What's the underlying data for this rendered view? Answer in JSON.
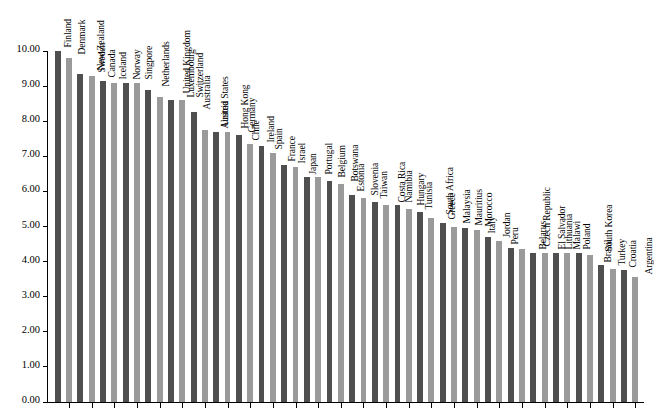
{
  "chart_data": {
    "type": "bar",
    "title": "",
    "subtitle": "",
    "xlabel": "",
    "ylabel": "",
    "ylim": [
      0.0,
      10.0
    ],
    "ytick_labels": [
      "0.00",
      "1.00",
      "2.00",
      "3.00",
      "4.00",
      "5.00",
      "6.00",
      "7.00",
      "8.00",
      "9.00",
      "10.00"
    ],
    "ytick_values": [
      0,
      1,
      2,
      3,
      4,
      5,
      6,
      7,
      8,
      9,
      10
    ],
    "grid": false,
    "legend": "none",
    "bar_colors": {
      "dark": "#4f4f4f",
      "light": "#9a9a9a"
    },
    "bar_color_pattern": "alternating dark/light by index",
    "axis_color": "#000000",
    "background": "#ffffff",
    "label_rotation_deg": 90,
    "categories": [
      "Finland",
      "Denmark",
      "New Zealand",
      "Sweden",
      "Canada",
      "Iceland",
      "Norway",
      "Singpore",
      "Netherlands",
      "United Kingdom",
      "Luxembourg",
      "Switzerland",
      "Australia",
      "United States",
      "Austria",
      "Hong Kong",
      "Germany",
      "Chile",
      "Ireland",
      "Spain",
      "France",
      "Israel",
      "Japan",
      "Portugal",
      "Belgium",
      "Botswana",
      "Estonia",
      "Slovenia",
      "Taiwan",
      "Costa Rica",
      "Namibia",
      "Hungary",
      "Tunisia",
      "South Africa",
      "Greece",
      "Malaysia",
      "Mauritius",
      "Morocco",
      "Italy",
      "Jordan",
      "Peru",
      "Czech Republic",
      "Belarus",
      "El Salvador",
      "Lithuania",
      "Malawi",
      "Poland",
      "South Korea",
      "Brazil",
      "Turkey",
      "Croatia",
      "Argentina"
    ],
    "values": [
      10.0,
      9.8,
      9.35,
      9.3,
      9.15,
      9.1,
      9.1,
      9.1,
      8.9,
      8.7,
      8.6,
      8.6,
      8.25,
      7.75,
      7.7,
      7.7,
      7.6,
      7.35,
      7.3,
      7.1,
      6.75,
      6.7,
      6.4,
      6.4,
      6.3,
      6.2,
      5.9,
      5.8,
      5.7,
      5.6,
      5.6,
      5.5,
      5.4,
      5.25,
      5.1,
      5.0,
      4.95,
      4.9,
      4.7,
      4.6,
      4.4,
      4.35,
      4.25,
      4.25,
      4.25,
      4.25,
      4.25,
      4.2,
      3.9,
      3.8,
      3.75,
      3.55
    ]
  }
}
